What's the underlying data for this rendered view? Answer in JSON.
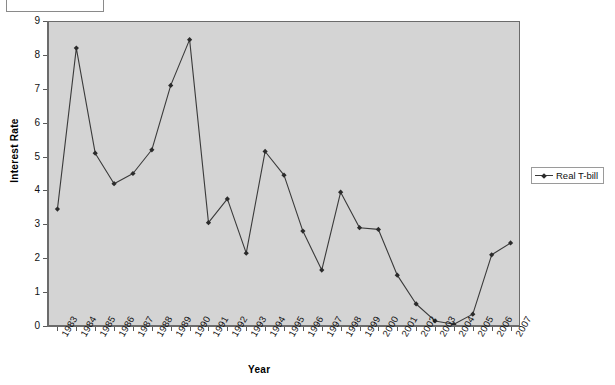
{
  "title_box": {
    "text": ""
  },
  "axes": {
    "y_title": "Interest Rate",
    "x_title": "Year",
    "y_ticks": [
      "0",
      "1",
      "2",
      "3",
      "4",
      "5",
      "6",
      "7",
      "8",
      "9"
    ]
  },
  "legend": {
    "position": "right",
    "entries": [
      {
        "label": "Real T-bill",
        "marker": "diamond-marker-icon",
        "color": "#3a3a3a"
      }
    ]
  },
  "colors": {
    "plot_background": "#d4d4d4",
    "page_background": "#ffffff",
    "series_line": "#3a3a3a",
    "marker": "#2b2b2b",
    "axis": "#6b6b6b"
  },
  "chart_data": {
    "type": "line",
    "title": "",
    "xlabel": "Year",
    "ylabel": "Interest Rate",
    "ylim": [
      0,
      9
    ],
    "ytick_step": 1,
    "grid": false,
    "legend_position": "right",
    "categories": [
      "1983",
      "1984",
      "1985",
      "1986",
      "1987",
      "1988",
      "1989",
      "1990",
      "1991",
      "1992",
      "1993",
      "1994",
      "1995",
      "1996",
      "1997",
      "1998",
      "1999",
      "2000",
      "2001",
      "2002",
      "2003",
      "2004",
      "2005",
      "2006",
      "2007"
    ],
    "series": [
      {
        "name": "Real T-bill",
        "marker": "diamond",
        "values": [
          3.45,
          8.2,
          5.1,
          4.2,
          4.5,
          5.2,
          7.1,
          8.45,
          3.05,
          3.75,
          2.15,
          5.15,
          4.45,
          2.8,
          1.65,
          3.95,
          2.9,
          2.85,
          1.5,
          0.65,
          0.15,
          0.05,
          0.35,
          2.1,
          2.45
        ]
      }
    ]
  }
}
